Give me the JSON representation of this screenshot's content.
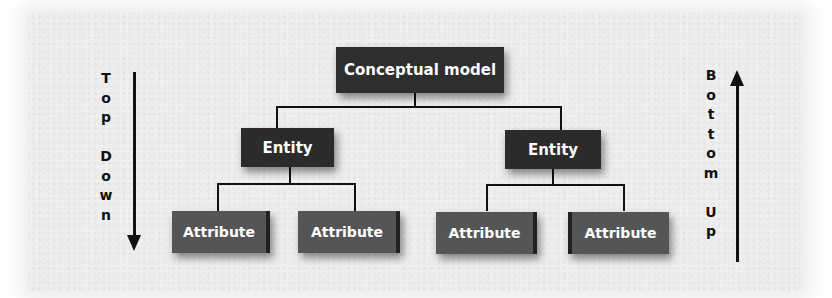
{
  "diagram": {
    "root": {
      "label": "Conceptual model"
    },
    "entities": [
      {
        "label": "Entity",
        "attributes": [
          {
            "label": "Attribute"
          },
          {
            "label": "Attribute"
          }
        ]
      },
      {
        "label": "Entity",
        "attributes": [
          {
            "label": "Attribute"
          },
          {
            "label": "Attribute"
          }
        ]
      }
    ],
    "left_direction": {
      "label": "Top Down",
      "letters": [
        "T",
        "o",
        "p",
        "",
        "D",
        "o",
        "w",
        "n"
      ],
      "arrow": "down"
    },
    "right_direction": {
      "label": "Bottom Up",
      "letters": [
        "B",
        "o",
        "t",
        "t",
        "o",
        "m",
        "",
        "U",
        "p"
      ],
      "arrow": "up"
    }
  },
  "colors": {
    "background": "#efefef",
    "root_box": "#2e2e2e",
    "entity_box": "#2b2b2b",
    "attribute_box": "#555555",
    "lines": "#111111",
    "box_text": "#ffffff"
  }
}
